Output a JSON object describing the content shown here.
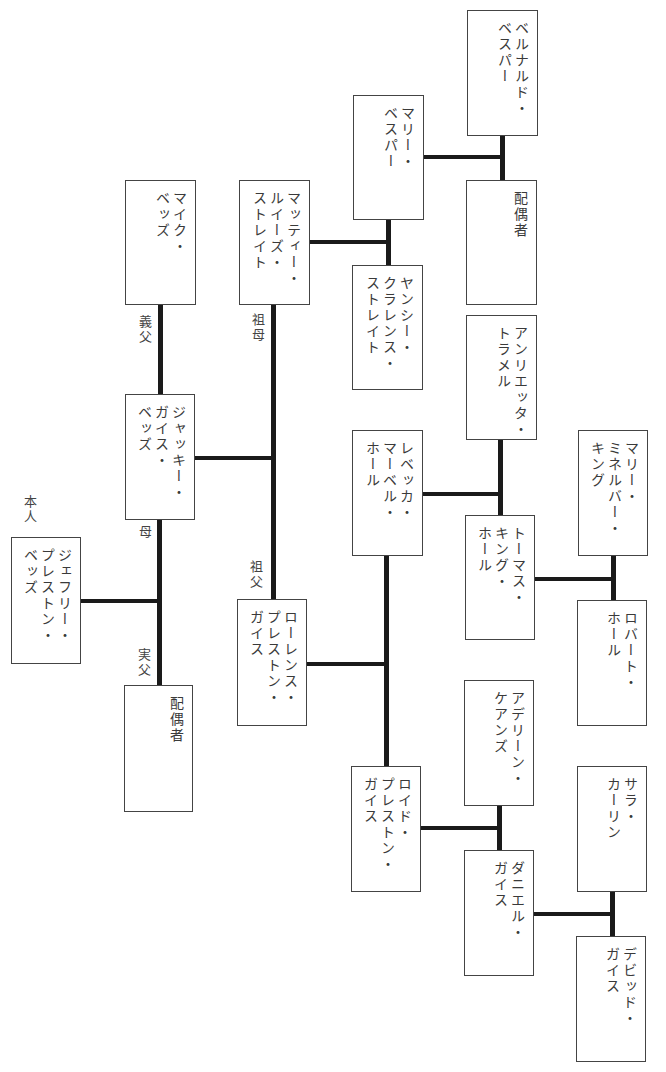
{
  "people": {
    "bernardo": {
      "name": "ベルナルド・\nベスパー"
    },
    "spouse_top": {
      "name": "配偶者"
    },
    "mary_vesper": {
      "name": "マリー・\nベスパー"
    },
    "yancey": {
      "name": "ヤンシー・\nクラレンス・\nストレイト"
    },
    "mattie": {
      "name": "マッティー・\nルイーズ・\nストレイト"
    },
    "mike": {
      "name": "マイク・\nベッズ"
    },
    "jackie": {
      "name": "ジャッキー・\nガイス・\nベッズ"
    },
    "jeffrey": {
      "name": "ジェフリー・\nプレストン・\nベッズ"
    },
    "spouse_bottom": {
      "name": "配偶者"
    },
    "lawrence": {
      "name": "ローレンス・\nプレストン・\nガイス"
    },
    "rebecca": {
      "name": "レベッカ・\nマーベル・\nホール"
    },
    "henrietta": {
      "name": "アンリエッタ・\nトラメル"
    },
    "thomas": {
      "name": "トーマス・\nキング・\nホール"
    },
    "mary_minerva": {
      "name": "マリー・\nミネルバー・\nキング"
    },
    "robert": {
      "name": "ロバート・\nホール"
    },
    "lloyd": {
      "name": "ロイド・\nプレストン・\nガイス"
    },
    "adeline": {
      "name": "アデリーン・\nケアンズ"
    },
    "daniel": {
      "name": "ダニエル・\nガイス"
    },
    "sarah": {
      "name": "サラ・\nカーリン"
    },
    "david": {
      "name": "デビッド・\nガイス"
    }
  },
  "labels": {
    "self": "本人",
    "mother": "母",
    "stepfather": "義父",
    "biological_father": "実父",
    "grandmother": "祖母",
    "grandfather": "祖父"
  }
}
